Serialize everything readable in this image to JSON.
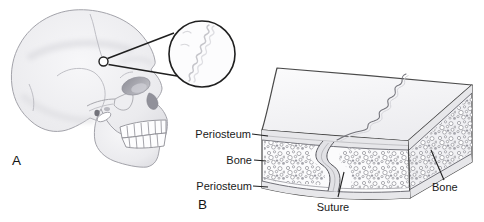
{
  "colors": {
    "ink": "#1f1f1f",
    "block_outline": "#4a4a4a",
    "skull_outline": "#a3a3aa",
    "suture_detail_line": "#c6c6cb",
    "label_text": "#1a1a1a"
  },
  "panel_a": {
    "label": "A"
  },
  "panel_b": {
    "label": "B",
    "labels": {
      "periosteum_top": "Periosteum",
      "bone_left": "Bone",
      "periosteum_bottom": "Periosteum",
      "suture": "Suture",
      "bone_right": "Bone"
    }
  }
}
